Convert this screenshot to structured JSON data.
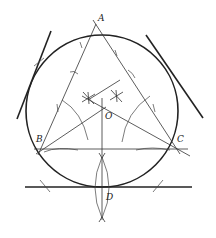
{
  "diagram": {
    "points": {
      "A": {
        "label": "A",
        "x": 96,
        "y": 27
      },
      "B": {
        "label": "B",
        "x": 40,
        "y": 150
      },
      "C": {
        "label": "C",
        "x": 177,
        "y": 150
      },
      "O": {
        "label": "O",
        "x": 102,
        "y": 110
      },
      "D": {
        "label": "D",
        "x": 102,
        "y": 187
      }
    },
    "circle": {
      "cx": 102,
      "cy": 111,
      "r": 76
    },
    "tangent_lines": [
      {
        "name": "left",
        "x1": 51,
        "y1": 31,
        "x2": 17,
        "y2": 119
      },
      {
        "name": "right",
        "x1": 146,
        "y1": 35,
        "x2": 203,
        "y2": 118
      },
      {
        "name": "bottom",
        "x1": 25,
        "y1": 187,
        "x2": 192,
        "y2": 187
      }
    ],
    "colors": {
      "stroke": "#222222",
      "background": "#ffffff"
    }
  }
}
